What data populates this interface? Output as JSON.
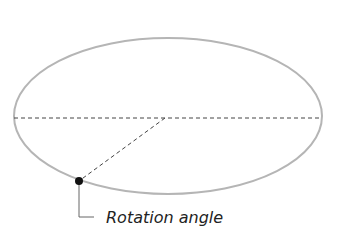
{
  "diagram": {
    "label": "Rotation angle",
    "colors": {
      "ellipse_stroke": "#b5b5b5",
      "dashed_line": "#444444",
      "point": "#111111",
      "leader": "#666666",
      "text": "#222222"
    },
    "ellipse": {
      "cx": 168,
      "cy": 116,
      "rx": 154,
      "ry": 78
    },
    "center": {
      "x": 165,
      "y": 118
    },
    "point": {
      "x": 79,
      "y": 181
    }
  }
}
